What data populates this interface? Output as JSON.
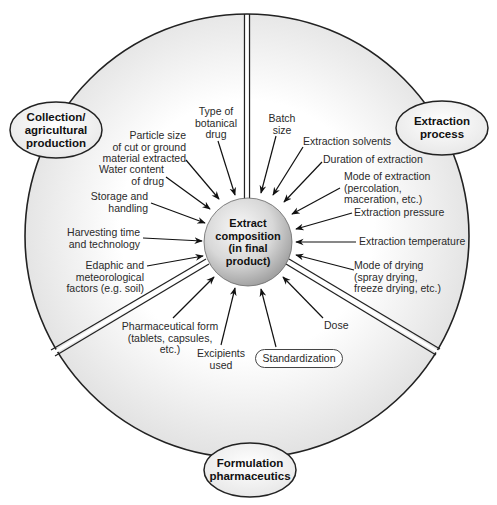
{
  "diagram": {
    "center": {
      "label": "Extract\ncomposition\n(in final\nproduct)"
    },
    "sectors": {
      "collection": {
        "title": "Collection/\nagricultural\nproduction",
        "factors": [
          {
            "id": "type-of-botanical-drug",
            "label": "Type of\nbotanical\ndrug"
          },
          {
            "id": "particle-size",
            "label": "Particle size\nof cut or ground\nmaterial extracted"
          },
          {
            "id": "water-content",
            "label": "Water content\nof drug"
          },
          {
            "id": "storage-handling",
            "label": "Storage and\nhandling"
          },
          {
            "id": "harvesting",
            "label": "Harvesting time\nand technology"
          },
          {
            "id": "edaphic",
            "label": "Edaphic and\nmeteorological\nfactors (e.g. soil)"
          }
        ]
      },
      "extraction": {
        "title": "Extraction\nprocess",
        "factors": [
          {
            "id": "batch-size",
            "label": "Batch\nsize"
          },
          {
            "id": "extraction-solvents",
            "label": "Extraction solvents"
          },
          {
            "id": "duration-of-extraction",
            "label": "Duration of extraction"
          },
          {
            "id": "mode-of-extraction",
            "label": "Mode of extraction\n(percolation,\nmaceration, etc.)"
          },
          {
            "id": "extraction-pressure",
            "label": "Extraction pressure"
          },
          {
            "id": "extraction-temperature",
            "label": "Extraction temperature"
          },
          {
            "id": "mode-of-drying",
            "label": "Mode of drying\n(spray drying,\nfreeze drying, etc.)"
          }
        ]
      },
      "formulation": {
        "title": "Formulation\npharmaceutics",
        "factors": [
          {
            "id": "dose",
            "label": "Dose"
          },
          {
            "id": "standardization",
            "label": "Standardization"
          },
          {
            "id": "excipients",
            "label": "Excipients\nused"
          },
          {
            "id": "pharmaceutical-form",
            "label": "Pharmaceutical form\n(tablets, capsules,\netc.)"
          }
        ]
      }
    },
    "colors": {
      "outline": "#222222",
      "fill_light": "#ffffff",
      "fill_shade": "#e4e4e4",
      "center_fill_light": "#f4f4f4",
      "center_fill_dark": "#a8a8a8"
    }
  }
}
